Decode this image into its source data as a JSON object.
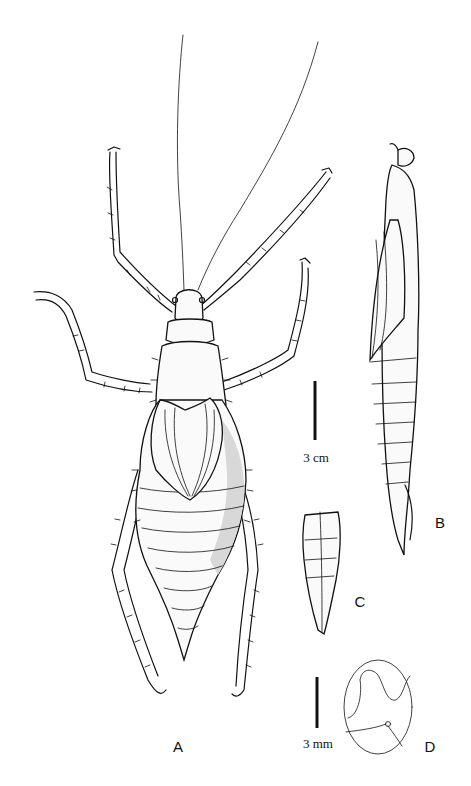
{
  "figure": {
    "panels": [
      {
        "id": "A",
        "label": "A",
        "description": "dorsal view of whole insect"
      },
      {
        "id": "B",
        "label": "B",
        "description": "lateral view of body"
      },
      {
        "id": "C",
        "label": "C",
        "description": "terminal abdominal segments"
      },
      {
        "id": "D",
        "label": "D",
        "description": "egg"
      }
    ],
    "scale_bars": [
      {
        "id": "large",
        "label": "3 cm",
        "applies_to": [
          "A",
          "B",
          "C"
        ]
      },
      {
        "id": "small",
        "label": "3 mm",
        "applies_to": [
          "D"
        ]
      }
    ],
    "colors": {
      "ink": "#111111",
      "background": "#ffffff"
    }
  }
}
